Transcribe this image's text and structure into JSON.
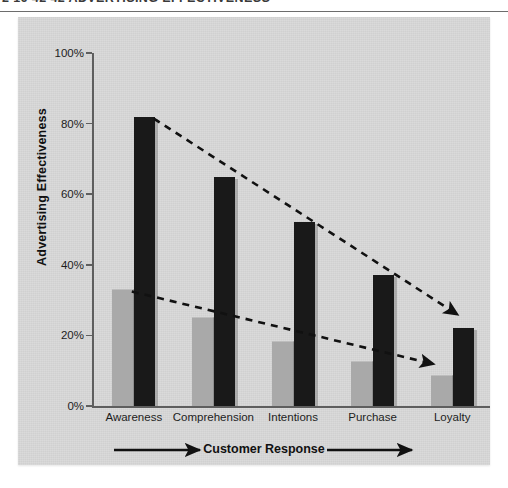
{
  "header": {
    "text": "2  16  42  42  ADVERTISING EFFECTIVENESS"
  },
  "chart_data": {
    "type": "bar",
    "title": "",
    "subtitle": "",
    "xlabel": "Customer Response",
    "ylabel": "Advertising Effectiveness",
    "categories": [
      "Awareness",
      "Comprehension",
      "Intentions",
      "Purchase",
      "Loyalty"
    ],
    "series": [
      {
        "name": "light-gray-series",
        "color": "#a9a9a9",
        "values": [
          33,
          25,
          18,
          12.5,
          8.5
        ]
      },
      {
        "name": "dark-series",
        "color": "#191919",
        "values": [
          82,
          65,
          52,
          37,
          22
        ]
      }
    ],
    "ylim": [
      0,
      100
    ],
    "ytick_values": [
      0,
      20,
      40,
      60,
      80,
      100
    ],
    "ytick_labels": [
      "0%",
      "20%",
      "40%",
      "60%",
      "80%",
      "100%"
    ],
    "grid": false,
    "legend": "none",
    "annotations": [
      {
        "name": "dark-series-decline-arrow",
        "style": "dashed-arrow",
        "from_point": "top of dark bar at Awareness (82%)",
        "to_point": "top of dark bar at Loyalty (22%)"
      },
      {
        "name": "gray-series-decline-arrow",
        "style": "dashed-arrow",
        "from_point": "top of gray bar at Awareness (33%)",
        "to_point": "top of gray bar at Loyalty (8.5%)"
      },
      {
        "name": "customer-response-axis-arrow",
        "style": "solid-arrow-right",
        "label": "Customer Response"
      }
    ]
  },
  "colors": {
    "panel_background": "#d7d7d7",
    "page_background": "#ffffff",
    "axis": "#5e5e5e",
    "text": "#1d1d1d",
    "gray_bar": "#a9a9a9",
    "dark_bar": "#191919"
  }
}
